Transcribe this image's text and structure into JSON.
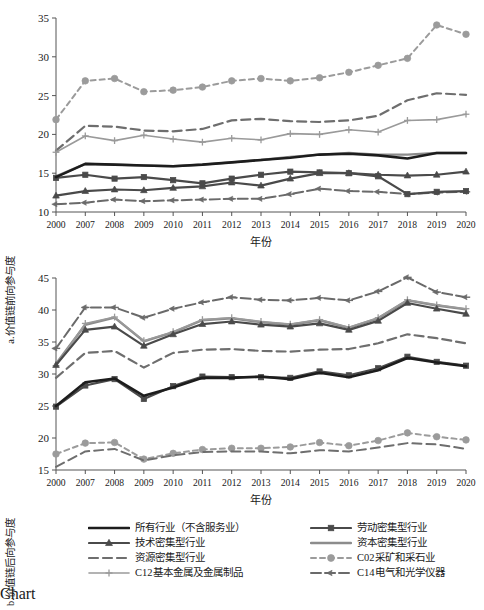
{
  "figure": {
    "xlabel": "年份",
    "years": [
      "2000",
      "2007",
      "2008",
      "2009",
      "2010",
      "2011",
      "2012",
      "2013",
      "2014",
      "2015",
      "2016",
      "2017",
      "2018",
      "2019",
      "2020"
    ]
  },
  "legend": {
    "items": [
      {
        "key": "all",
        "label": "所有行业（不含服务业）",
        "color": "#1d1d1d",
        "dash": "none",
        "marker": "none",
        "width": 2.6
      },
      {
        "key": "labor",
        "label": "劳动密集型行业",
        "color": "#4a4a4a",
        "dash": "none",
        "marker": "square",
        "width": 2.2
      },
      {
        "key": "tech",
        "label": "技术密集型行业",
        "color": "#4a4a4a",
        "dash": "none",
        "marker": "triangle",
        "width": 2.2
      },
      {
        "key": "capital",
        "label": "资本密集型行业",
        "color": "#8c8c8c",
        "dash": "none",
        "marker": "none",
        "width": 2.4
      },
      {
        "key": "resource",
        "label": "资源密集型行业",
        "color": "#6e6e6e",
        "dash": "long",
        "marker": "none",
        "width": 2.2
      },
      {
        "key": "c02",
        "label": "C02采矿和采石业",
        "color": "#9b9b9b",
        "dash": "short",
        "marker": "circle",
        "width": 2.0
      },
      {
        "key": "c12",
        "label": "C12基本金属及金属制品",
        "color": "#9a9a9a",
        "dash": "none",
        "marker": "plus",
        "width": 1.6
      },
      {
        "key": "c14",
        "label": "C14电气和光学仪器",
        "color": "#6a6a6a",
        "dash": "dashdot",
        "marker": "arrow",
        "width": 2.0
      }
    ]
  },
  "chart_data": [
    {
      "id": "a",
      "type": "line",
      "title": "a.价值链前向参与度",
      "ylabel": "a.价值链前向参与度",
      "xlabel": "年份",
      "grid": false,
      "legend_position": "below-figure",
      "ylim": [
        10,
        35
      ],
      "yticks": [
        10,
        15,
        20,
        25,
        30,
        35
      ],
      "x": [
        "2000",
        "2007",
        "2008",
        "2009",
        "2010",
        "2011",
        "2012",
        "2013",
        "2014",
        "2015",
        "2016",
        "2017",
        "2018",
        "2019",
        "2020"
      ],
      "series": [
        {
          "name": "所有行业（不含服务业）",
          "key": "all",
          "values": [
            14.5,
            16.2,
            16.1,
            16.0,
            15.9,
            16.1,
            16.4,
            16.7,
            17.0,
            17.4,
            17.5,
            17.3,
            16.9,
            17.6,
            17.6
          ]
        },
        {
          "name": "劳动密集型行业",
          "key": "labor",
          "values": [
            14.4,
            14.8,
            14.3,
            14.5,
            14.1,
            13.7,
            14.3,
            14.8,
            15.2,
            15.1,
            15.0,
            14.6,
            12.3,
            12.6,
            12.7
          ]
        },
        {
          "name": "技术密集型行业",
          "key": "tech",
          "values": [
            12.1,
            12.7,
            12.9,
            12.8,
            13.1,
            13.3,
            13.8,
            13.4,
            14.3,
            15.0,
            15.0,
            14.8,
            14.7,
            14.8,
            15.2
          ]
        },
        {
          "name": "资本密集型行业",
          "key": "capital",
          "values": [
            14.6,
            16.2,
            16.1,
            16.0,
            15.9,
            16.1,
            16.4,
            16.7,
            17.1,
            17.4,
            17.6,
            17.4,
            17.4,
            17.6,
            17.6
          ]
        },
        {
          "name": "资源密集型行业",
          "key": "resource",
          "values": [
            17.9,
            21.1,
            21.0,
            20.5,
            20.4,
            20.7,
            21.8,
            22.0,
            21.7,
            21.6,
            21.8,
            22.4,
            24.4,
            25.3,
            25.1
          ]
        },
        {
          "name": "C02采矿和采石业",
          "key": "c02",
          "values": [
            21.9,
            26.9,
            27.2,
            25.5,
            25.7,
            26.1,
            26.9,
            27.2,
            26.9,
            27.3,
            28.0,
            28.9,
            29.8,
            34.1,
            32.9
          ]
        },
        {
          "name": "C12基本金属及金属制品",
          "key": "c12",
          "values": [
            17.7,
            19.8,
            19.2,
            19.9,
            19.4,
            19.0,
            19.5,
            19.3,
            20.1,
            20.0,
            20.6,
            20.3,
            21.8,
            21.9,
            22.6
          ]
        },
        {
          "name": "C14电气和光学仪器",
          "key": "c14",
          "values": [
            11.0,
            11.2,
            11.6,
            11.4,
            11.5,
            11.6,
            11.7,
            11.7,
            12.3,
            13.0,
            12.7,
            12.6,
            12.3,
            12.5,
            12.6
          ]
        }
      ]
    },
    {
      "id": "b",
      "type": "line",
      "title": "b.价值链后向参与度",
      "ylabel": "b.价值链后向参与度",
      "xlabel": "年份",
      "grid": false,
      "legend_position": "below-figure",
      "ylim": [
        15,
        45
      ],
      "yticks": [
        15,
        20,
        25,
        30,
        35,
        40,
        45
      ],
      "x": [
        "2000",
        "2007",
        "2008",
        "2009",
        "2010",
        "2011",
        "2012",
        "2013",
        "2014",
        "2015",
        "2016",
        "2017",
        "2018",
        "2019",
        "2020"
      ],
      "series": [
        {
          "name": "所有行业（不含服务业）",
          "key": "all",
          "values": [
            25.0,
            28.7,
            29.3,
            26.6,
            27.9,
            29.4,
            29.4,
            29.6,
            29.2,
            30.2,
            29.5,
            30.6,
            32.5,
            31.8,
            31.2
          ]
        },
        {
          "name": "劳动密集型行业",
          "key": "labor",
          "values": [
            24.9,
            28.2,
            29.2,
            26.1,
            28.1,
            29.6,
            29.5,
            29.5,
            29.4,
            30.4,
            29.8,
            30.9,
            32.7,
            31.9,
            31.3
          ]
        },
        {
          "name": "技术密集型行业",
          "key": "tech",
          "values": [
            31.4,
            36.9,
            37.4,
            34.4,
            36.2,
            37.8,
            38.2,
            37.7,
            37.4,
            37.9,
            36.9,
            38.3,
            41.1,
            40.2,
            39.4
          ]
        },
        {
          "name": "资本密集型行业",
          "key": "capital",
          "values": [
            31.6,
            37.7,
            38.8,
            35.1,
            36.5,
            38.4,
            38.7,
            38.1,
            37.7,
            38.4,
            37.2,
            38.7,
            41.5,
            40.7,
            40.1
          ]
        },
        {
          "name": "资源密集型行业",
          "key": "resource",
          "values": [
            29.4,
            33.3,
            33.6,
            31.0,
            33.3,
            33.8,
            33.9,
            33.6,
            33.5,
            33.8,
            33.9,
            34.8,
            36.2,
            35.6,
            34.8
          ]
        },
        {
          "name": "C02采矿和采石业",
          "key": "c02",
          "values": [
            17.5,
            19.2,
            19.3,
            16.7,
            17.6,
            18.2,
            18.4,
            18.4,
            18.6,
            19.3,
            18.8,
            19.6,
            20.8,
            20.2,
            19.7
          ]
        },
        {
          "name": "C12基本金属及金属制品",
          "key": "c12",
          "values": [
            31.3,
            37.9,
            38.9,
            35.2,
            36.6,
            38.5,
            38.8,
            38.2,
            37.8,
            38.5,
            37.3,
            38.8,
            41.6,
            40.8,
            40.2
          ]
        },
        {
          "name": "C14电气和光学仪器",
          "key": "c14",
          "values": [
            34.0,
            40.4,
            40.4,
            38.8,
            40.2,
            41.2,
            42.0,
            41.6,
            41.5,
            41.9,
            41.5,
            42.9,
            45.1,
            42.8,
            42.0
          ]
        }
      ]
    },
    {
      "id": "b_lower_dash",
      "type": "line",
      "title": "",
      "note": "lower dashed companion in panel b",
      "x": [
        "2000",
        "2007",
        "2008",
        "2009",
        "2010",
        "2011",
        "2012",
        "2013",
        "2014",
        "2015",
        "2016",
        "2017",
        "2018",
        "2019",
        "2020"
      ],
      "series": [
        {
          "name": "C02采矿和采石业-下",
          "key": "c02b",
          "values": [
            15.5,
            17.9,
            18.3,
            16.5,
            17.3,
            17.8,
            17.9,
            17.9,
            17.6,
            18.1,
            17.9,
            18.5,
            19.2,
            19.0,
            18.3
          ]
        }
      ]
    }
  ]
}
